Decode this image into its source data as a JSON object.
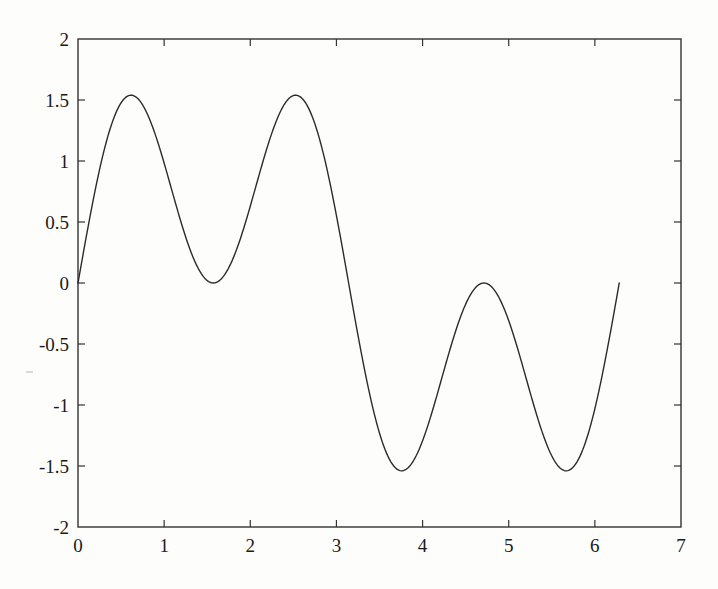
{
  "figure": {
    "background_color": "#fdfdfc",
    "axis_color": "#333333",
    "line_color": "#2b2b2b",
    "text_color": "#1a1a1a"
  },
  "axes": {
    "frame": {
      "left": 78,
      "top": 39,
      "right": 681,
      "bottom": 527
    },
    "box": true,
    "ticks_inward": true
  },
  "chart_data": {
    "type": "line",
    "title": "",
    "subtitle": "",
    "xlabel": "",
    "ylabel": "",
    "xlim": [
      0,
      7
    ],
    "ylim": [
      -2,
      2
    ],
    "grid": false,
    "legend": false,
    "legend_position": "none",
    "xticks": [
      0,
      1,
      2,
      3,
      4,
      5,
      6,
      7
    ],
    "xtick_labels": [
      "0",
      "1",
      "2",
      "3",
      "4",
      "5",
      "6",
      "7"
    ],
    "yticks": [
      -2,
      -1.5,
      -1,
      -0.5,
      0,
      0.5,
      1,
      1.5,
      2
    ],
    "ytick_labels": [
      "-2",
      "-1.5",
      "-1",
      "-0.5",
      "0",
      "0.5",
      "1",
      "1.5",
      "2"
    ],
    "series": [
      {
        "name": "f(x)",
        "x_domain": [
          0,
          6.2832
        ],
        "n_points": 401,
        "formula": "sin(x) + sin(3*x)",
        "line_width": 1.4,
        "color": "#2b2b2b",
        "annotations": {
          "start_point": [
            0,
            0.87
          ],
          "end_point": [
            6.2832,
            0.86
          ],
          "local_minima": [
            [
              0.75,
              -0.63
            ],
            [
              2.3,
              -1.88
            ],
            [
              3.88,
              -0.63
            ],
            [
              5.45,
              -1.88
            ]
          ],
          "local_maxima": [
            [
              1.5,
              1.87
            ],
            [
              3.14,
              0.87
            ],
            [
              4.65,
              1.87
            ]
          ]
        }
      }
    ]
  }
}
